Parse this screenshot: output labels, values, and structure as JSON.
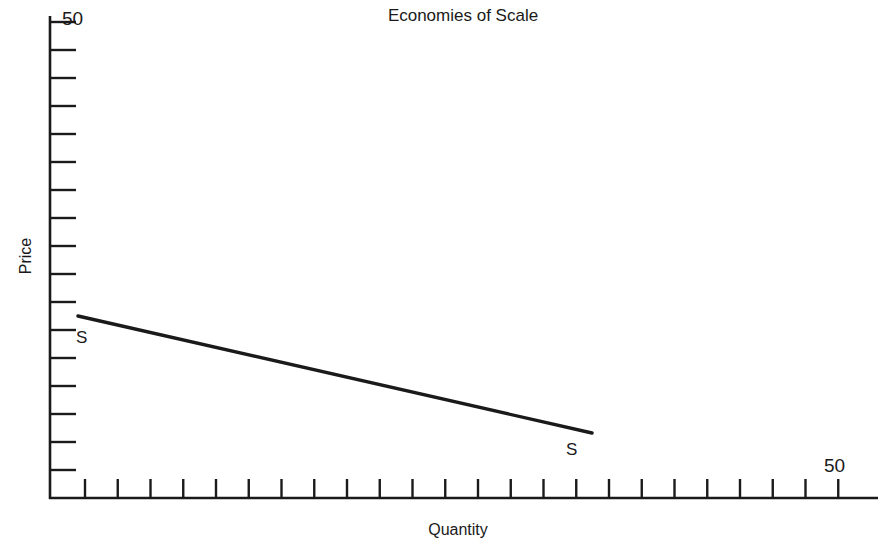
{
  "chart_data": {
    "type": "line",
    "title": "Economies of Scale",
    "xlabel": "Quantity",
    "ylabel": "Price",
    "xlim": [
      0,
      50
    ],
    "ylim": [
      0,
      50
    ],
    "grid": false,
    "legend": "none",
    "axis_style": "ticks-only, no numeric tick labels except axis maxima",
    "x_axis_max_label": "50",
    "y_axis_max_label": "50",
    "x_tick_count": 24,
    "y_tick_count": 18,
    "series": [
      {
        "name": "S",
        "label_start": "S",
        "label_end": "S",
        "description": "Downward sloping supply curve illustrating economies of scale",
        "x": [
          2,
          33
        ],
        "y": [
          19.5,
          13.5
        ],
        "points_px": [
          [
            78,
            316
          ],
          [
            592,
            433
          ]
        ]
      }
    ],
    "annotations": [
      {
        "text": "S",
        "x": 2,
        "y": 18.0,
        "position": "below-left-of-line-start"
      },
      {
        "text": "S",
        "x": 33,
        "y": 12.3,
        "position": "below-right-of-line-end"
      }
    ]
  }
}
